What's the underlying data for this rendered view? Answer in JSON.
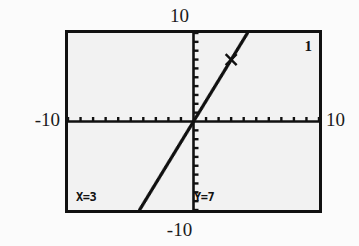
{
  "screen": {
    "device": "graphing-calculator",
    "mode": "trace",
    "plot_number": "1",
    "border_color": "#111111",
    "screen_background": "#f2f2f2",
    "ink_color": "#111111"
  },
  "axis_labels": {
    "ymax": "10",
    "ymin": "-10",
    "xmin": "-10",
    "xmax": "10"
  },
  "trace_readout": {
    "x_label": "X=3",
    "y_label": "Y=7",
    "x_value": 3,
    "y_value": 7
  },
  "chart_data": {
    "type": "line",
    "title": "",
    "xlabel": "",
    "ylabel": "",
    "xlim": [
      -10,
      10
    ],
    "ylim": [
      -10,
      10
    ],
    "xscl": 1,
    "yscl": 1,
    "grid": false,
    "axes_visible": true,
    "tick_marks": {
      "x_axis_count": 20,
      "y_axis_count": 20,
      "spacing": 1
    },
    "series": [
      {
        "name": "Y1",
        "style": "dotted",
        "slope": 2.3333,
        "intercept": 0,
        "x": [
          -4.3,
          -3,
          -2,
          -1,
          0,
          1,
          2,
          3,
          4.3
        ],
        "y": [
          -10,
          -7,
          -4.667,
          -2.333,
          0,
          2.333,
          4.667,
          7,
          10
        ]
      }
    ],
    "cursor": {
      "label": "trace-cursor",
      "glyph": "x",
      "x": 3,
      "y": 7
    },
    "legend": "none"
  }
}
